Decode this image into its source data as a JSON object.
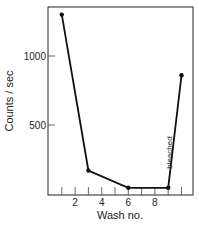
{
  "chart_data": {
    "type": "line",
    "title": "",
    "xlabel": "Wash no.",
    "ylabel": "Counts / sec",
    "x": [
      1,
      3,
      6,
      9,
      10
    ],
    "series": [
      {
        "name": "Counts",
        "values": [
          1300,
          170,
          45,
          45,
          860
        ]
      }
    ],
    "xticks": [
      1,
      2,
      3,
      4,
      5,
      6,
      7,
      8,
      9,
      10
    ],
    "xtick_labels": [
      "2",
      "4",
      "6",
      "8"
    ],
    "xtick_label_values": [
      2,
      4,
      6,
      8
    ],
    "yticks": [
      500,
      1000
    ],
    "ytick_labels": [
      "500",
      "1000"
    ],
    "xlim": [
      0,
      11
    ],
    "ylim": [
      0,
      1360
    ],
    "grid": false,
    "annotations": [
      {
        "text": "bleached",
        "x": 9.3,
        "y": 300,
        "rotation": -90
      }
    ]
  }
}
